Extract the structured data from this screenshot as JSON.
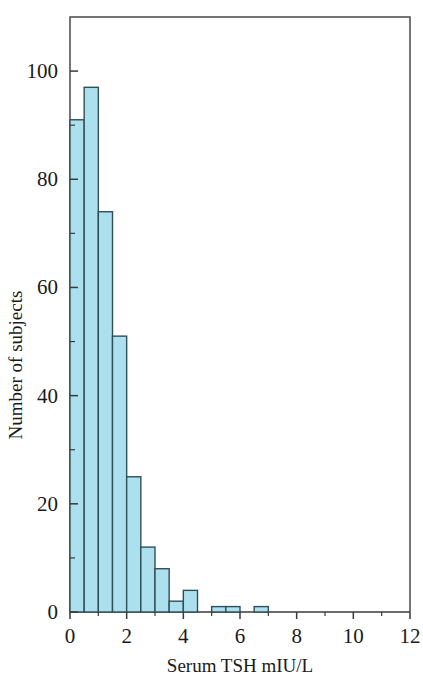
{
  "chart_data": {
    "type": "bar",
    "title": "",
    "subtitle": "",
    "xlabel": "Serum TSH mIU/L",
    "ylabel": "Number of subjects",
    "xlim": [
      0,
      12
    ],
    "ylim": [
      0,
      110
    ],
    "grid": false,
    "legend": null,
    "bin_width": 0.5,
    "x_ticks": [
      0,
      2,
      4,
      6,
      8,
      10,
      12
    ],
    "x_tick_labels": [
      "0",
      "2",
      "4",
      "6",
      "8",
      "10",
      "12"
    ],
    "x_minor_ticks": [
      1,
      3,
      5,
      7,
      9,
      11
    ],
    "y_ticks": [
      0,
      20,
      40,
      60,
      80,
      100
    ],
    "y_tick_labels": [
      "0",
      "20",
      "40",
      "60",
      "80",
      "100"
    ],
    "y_minor_ticks": [
      10,
      30,
      50,
      70,
      90
    ],
    "bar_fill": "#ade0ee",
    "bar_edge": "#2f4f57",
    "bins": [
      {
        "x0": 0.0,
        "x1": 0.5,
        "value": 91
      },
      {
        "x0": 0.5,
        "x1": 1.0,
        "value": 97
      },
      {
        "x0": 1.0,
        "x1": 1.5,
        "value": 74
      },
      {
        "x0": 1.5,
        "x1": 2.0,
        "value": 51
      },
      {
        "x0": 2.0,
        "x1": 2.5,
        "value": 25
      },
      {
        "x0": 2.5,
        "x1": 3.0,
        "value": 12
      },
      {
        "x0": 3.0,
        "x1": 3.5,
        "value": 8
      },
      {
        "x0": 3.5,
        "x1": 4.0,
        "value": 2
      },
      {
        "x0": 4.0,
        "x1": 4.5,
        "value": 4
      },
      {
        "x0": 4.5,
        "x1": 5.0,
        "value": 0
      },
      {
        "x0": 5.0,
        "x1": 5.5,
        "value": 1
      },
      {
        "x0": 5.5,
        "x1": 6.0,
        "value": 1
      },
      {
        "x0": 6.0,
        "x1": 6.5,
        "value": 0
      },
      {
        "x0": 6.5,
        "x1": 7.0,
        "value": 1
      },
      {
        "x0": 7.0,
        "x1": 7.5,
        "value": 0
      },
      {
        "x0": 7.5,
        "x1": 8.0,
        "value": 0
      },
      {
        "x0": 8.0,
        "x1": 8.5,
        "value": 0
      },
      {
        "x0": 8.5,
        "x1": 9.0,
        "value": 0
      },
      {
        "x0": 9.0,
        "x1": 9.5,
        "value": 0
      },
      {
        "x0": 9.5,
        "x1": 10.0,
        "value": 0
      },
      {
        "x0": 10.0,
        "x1": 10.5,
        "value": 0
      },
      {
        "x0": 10.5,
        "x1": 11.0,
        "value": 0
      },
      {
        "x0": 11.0,
        "x1": 11.5,
        "value": 0
      },
      {
        "x0": 11.5,
        "x1": 12.0,
        "value": 0
      }
    ]
  }
}
